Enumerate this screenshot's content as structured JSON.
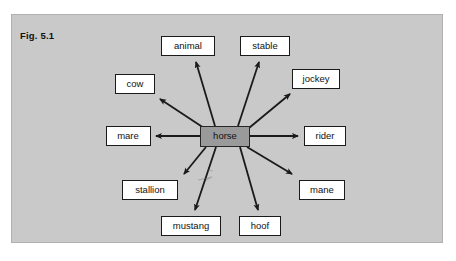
{
  "figure": {
    "label": "Fig. 5.1",
    "type": "radial-word-association-diagram",
    "panel_color": "#c9c9c9",
    "node_color": "#ffffff",
    "center_node_color": "#9a9a9a",
    "edge_color": "#1a1a1a"
  },
  "center": {
    "label": "horse",
    "x": 225,
    "y": 136,
    "width": 50,
    "height": 21
  },
  "nodes": [
    {
      "id": "animal",
      "label": "animal",
      "x": 188,
      "y": 46,
      "width": 54,
      "height": 20,
      "anchor_x": 194,
      "anchor_y": 58,
      "arrow_x": 196,
      "arrow_y": 62
    },
    {
      "id": "stable",
      "label": "stable",
      "x": 265,
      "y": 46,
      "width": 50,
      "height": 20,
      "anchor_x": 261,
      "anchor_y": 58,
      "arrow_x": 259,
      "arrow_y": 62
    },
    {
      "id": "cow",
      "label": "cow",
      "x": 135,
      "y": 84,
      "width": 40,
      "height": 20,
      "anchor_x": 156,
      "anchor_y": 96,
      "arrow_x": 160,
      "arrow_y": 99
    },
    {
      "id": "jockey",
      "label": "jockey",
      "x": 316,
      "y": 79,
      "width": 48,
      "height": 20,
      "anchor_x": 294,
      "anchor_y": 91,
      "arrow_x": 290,
      "arrow_y": 94
    },
    {
      "id": "mare",
      "label": "mare",
      "x": 128,
      "y": 136,
      "width": 45,
      "height": 20,
      "anchor_x": 152,
      "anchor_y": 136,
      "arrow_x": 156,
      "arrow_y": 136
    },
    {
      "id": "rider",
      "label": "rider",
      "x": 325,
      "y": 136,
      "width": 42,
      "height": 20,
      "anchor_x": 302,
      "anchor_y": 136,
      "arrow_x": 298,
      "arrow_y": 136
    },
    {
      "id": "stallion",
      "label": "stallion",
      "x": 150,
      "y": 190,
      "width": 56,
      "height": 20,
      "anchor_x": 180,
      "anchor_y": 178,
      "arrow_x": 184,
      "arrow_y": 174
    },
    {
      "id": "mane",
      "label": "mane",
      "x": 322,
      "y": 190,
      "width": 46,
      "height": 20,
      "anchor_x": 296,
      "anchor_y": 178,
      "arrow_x": 292,
      "arrow_y": 174
    },
    {
      "id": "mustang",
      "label": "mustang",
      "x": 191,
      "y": 226,
      "width": 60,
      "height": 20,
      "anchor_x": 193,
      "anchor_y": 214,
      "arrow_x": 195,
      "arrow_y": 210
    },
    {
      "id": "hoof",
      "label": "hoof",
      "x": 260,
      "y": 226,
      "width": 42,
      "height": 20,
      "anchor_x": 259,
      "anchor_y": 214,
      "arrow_x": 258,
      "arrow_y": 210
    }
  ],
  "edges": [
    {
      "from": "horse",
      "to": "animal",
      "x1": 215,
      "y1": 126,
      "x2": 196,
      "y2": 62
    },
    {
      "from": "horse",
      "to": "stable",
      "x1": 238,
      "y1": 126,
      "x2": 259,
      "y2": 62
    },
    {
      "from": "horse",
      "to": "cow",
      "x1": 204,
      "y1": 128,
      "x2": 160,
      "y2": 99
    },
    {
      "from": "horse",
      "to": "jockey",
      "x1": 249,
      "y1": 128,
      "x2": 290,
      "y2": 94
    },
    {
      "from": "horse",
      "to": "mare",
      "x1": 200,
      "y1": 136,
      "x2": 156,
      "y2": 136
    },
    {
      "from": "horse",
      "to": "rider",
      "x1": 250,
      "y1": 136,
      "x2": 298,
      "y2": 136
    },
    {
      "from": "horse",
      "to": "stallion",
      "x1": 206,
      "y1": 147,
      "x2": 184,
      "y2": 174
    },
    {
      "from": "horse",
      "to": "mane",
      "x1": 247,
      "y1": 147,
      "x2": 292,
      "y2": 174
    },
    {
      "from": "horse",
      "to": "mustang",
      "x1": 216,
      "y1": 147,
      "x2": 195,
      "y2": 210
    },
    {
      "from": "horse",
      "to": "hoof",
      "x1": 240,
      "y1": 147,
      "x2": 258,
      "y2": 210
    }
  ]
}
